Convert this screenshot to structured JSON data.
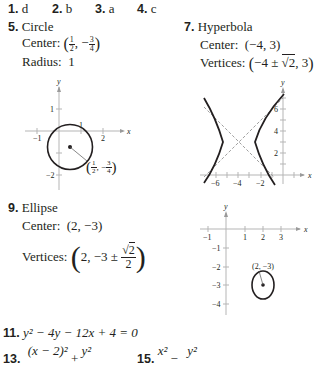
{
  "answers_row": [
    {
      "num": "1.",
      "answer": "d"
    },
    {
      "num": "2.",
      "answer": "b"
    },
    {
      "num": "3.",
      "answer": "a"
    },
    {
      "num": "4.",
      "answer": "c"
    }
  ],
  "problem5": {
    "num": "5.",
    "type": "Circle",
    "center_label": "Center:",
    "center": {
      "x_num": "1",
      "x_den": "2",
      "y_sign": "−",
      "y_num": "3",
      "y_den": "4"
    },
    "radius_label": "Radius:",
    "radius": "1",
    "graph": {
      "x_ticks": [
        "−1",
        "1",
        "2"
      ],
      "y_ticks": [
        "1",
        "−1",
        "−2"
      ],
      "x_axis_label": "x",
      "y_axis_label": "y",
      "point_label": {
        "x_num": "1",
        "x_den": "2",
        "y_sign": "−",
        "y_num": "3",
        "y_den": "4"
      }
    }
  },
  "problem7": {
    "num": "7.",
    "type": "Hyperbola",
    "center_label": "Center:",
    "center": "(−4, 3)",
    "vertices_label": "Vertices:",
    "vertices_pre": "−4 ± ",
    "vertices_root": "2",
    "vertices_post": ", 3",
    "graph": {
      "x_ticks": [
        "−6",
        "−4",
        "−2"
      ],
      "y_ticks": [
        "2",
        "4",
        "6"
      ],
      "x_axis_label": "x",
      "y_axis_label": "y"
    }
  },
  "problem9": {
    "num": "9.",
    "type": "Ellipse",
    "center_label": "Center:",
    "center": "(2, −3)",
    "vertices_label": "Vertices:",
    "vertices_pre": "2, −3 ± ",
    "vertices_root": "2",
    "vertices_den": "2",
    "graph": {
      "x_ticks": [
        "−1",
        "1",
        "2",
        "3"
      ],
      "y_ticks": [
        "−1",
        "−2",
        "−3",
        "−4"
      ],
      "x_axis_label": "x",
      "y_axis_label": "y",
      "point_label": "(2, −3)"
    }
  },
  "problem11": {
    "num": "11.",
    "equation": "y² − 4y − 12x + 4 = 0"
  },
  "problem13": {
    "num": "13.",
    "numerator1": "(x − 2)²",
    "op": "+",
    "numerator2": "y²"
  },
  "problem15": {
    "num": "15.",
    "numerator1": "x²",
    "op": "−",
    "numerator2": "y²"
  }
}
